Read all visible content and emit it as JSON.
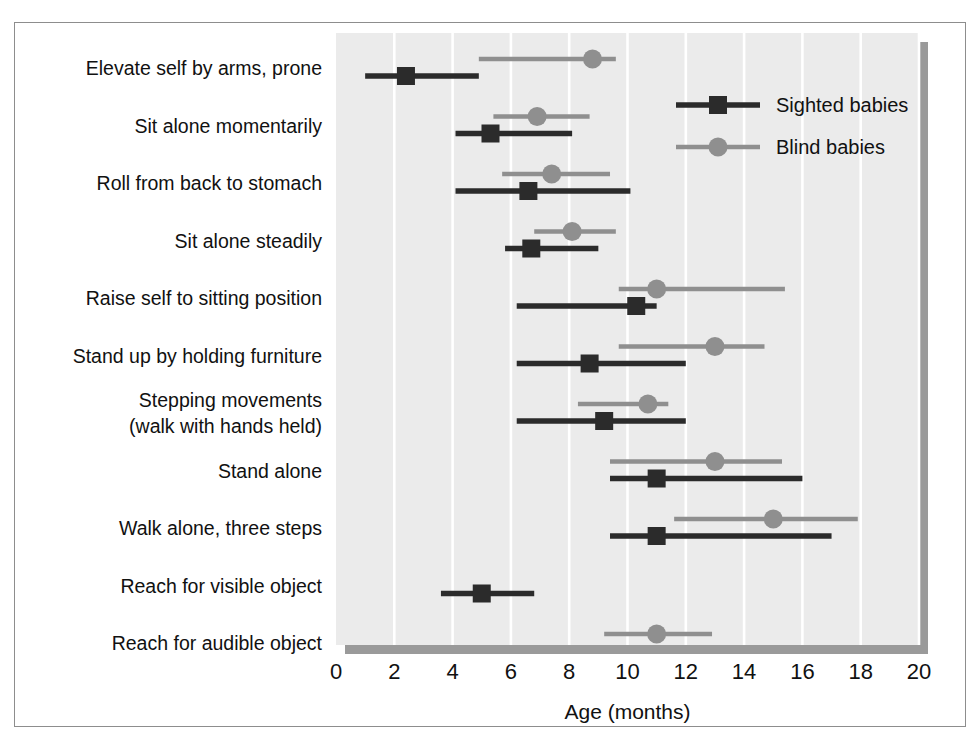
{
  "figure": {
    "border_color": "#8d8d8d",
    "background": "#ffffff"
  },
  "chart_data": {
    "type": "scatter",
    "subtype": "dot-plot-with-range-bars",
    "title": "",
    "xlabel": "Age (months)",
    "ylabel": "",
    "xlim": [
      0,
      20
    ],
    "xticks": [
      0,
      2,
      4,
      6,
      8,
      10,
      12,
      14,
      16,
      18,
      20
    ],
    "xtick_labels": [
      "0",
      "2",
      "4",
      "6",
      "8",
      "10",
      "12",
      "14",
      "16",
      "18",
      "20"
    ],
    "grid": "vertical",
    "grid_color": "#ffffff",
    "panel_color": "#ebebeb",
    "panel_shadow_color": "#9a9a9a",
    "legend_position": "top-right",
    "legend": [
      {
        "name": "Sighted babies",
        "marker": "square",
        "color": "#2b2b2b"
      },
      {
        "name": "Blind babies",
        "marker": "circle",
        "color": "#8f8f8f"
      }
    ],
    "categories": [
      "Elevate self by arms, prone",
      "Sit alone momentarily",
      "Roll from back to stomach",
      "Sit alone steadily",
      "Raise self to sitting position",
      "Stand up by holding furniture",
      "Stepping movements\n(walk with hands held)",
      "Stand alone",
      "Walk alone, three steps",
      "Reach for visible object",
      "Reach for audible object"
    ],
    "category_lines": [
      [
        "Elevate self by arms, prone"
      ],
      [
        "Sit alone momentarily"
      ],
      [
        "Roll from back to stomach"
      ],
      [
        "Sit alone steadily"
      ],
      [
        "Raise self to sitting position"
      ],
      [
        "Stand up by holding furniture"
      ],
      [
        "Stepping movements",
        "(walk with hands held)"
      ],
      [
        "Stand alone"
      ],
      [
        "Walk alone, three steps"
      ],
      [
        "Reach for visible object"
      ],
      [
        "Reach for audible object"
      ]
    ],
    "series": [
      {
        "name": "Sighted babies",
        "marker": "square",
        "color": "#2b2b2b",
        "points": [
          {
            "category": "Elevate self by arms, prone",
            "value": 2.4,
            "low": 1.0,
            "high": 4.9
          },
          {
            "category": "Sit alone momentarily",
            "value": 5.3,
            "low": 4.1,
            "high": 8.1
          },
          {
            "category": "Roll from back to stomach",
            "value": 6.6,
            "low": 4.1,
            "high": 10.1
          },
          {
            "category": "Sit alone steadily",
            "value": 6.7,
            "low": 5.8,
            "high": 9.0
          },
          {
            "category": "Raise self to sitting position",
            "value": 10.3,
            "low": 6.2,
            "high": 11.0
          },
          {
            "category": "Stand up by holding furniture",
            "value": 8.7,
            "low": 6.2,
            "high": 12.0
          },
          {
            "category": "Stepping movements",
            "value": 9.2,
            "low": 6.2,
            "high": 12.0
          },
          {
            "category": "Stand alone",
            "value": 11.0,
            "low": 9.4,
            "high": 16.0
          },
          {
            "category": "Walk alone, three steps",
            "value": 11.0,
            "low": 9.4,
            "high": 17.0
          },
          {
            "category": "Reach for visible object",
            "value": 5.0,
            "low": 3.6,
            "high": 6.8
          },
          {
            "category": "Reach for audible object",
            "value": null,
            "low": null,
            "high": null
          }
        ]
      },
      {
        "name": "Blind babies",
        "marker": "circle",
        "color": "#8f8f8f",
        "points": [
          {
            "category": "Elevate self by arms, prone",
            "value": 8.8,
            "low": 4.9,
            "high": 9.6
          },
          {
            "category": "Sit alone momentarily",
            "value": 6.9,
            "low": 5.4,
            "high": 8.7
          },
          {
            "category": "Roll from back to stomach",
            "value": 7.4,
            "low": 5.7,
            "high": 9.4
          },
          {
            "category": "Sit alone steadily",
            "value": 8.1,
            "low": 6.8,
            "high": 9.6
          },
          {
            "category": "Raise self to sitting position",
            "value": 11.0,
            "low": 9.7,
            "high": 15.4
          },
          {
            "category": "Stand up by holding furniture",
            "value": 13.0,
            "low": 9.7,
            "high": 14.7
          },
          {
            "category": "Stepping movements",
            "value": 10.7,
            "low": 8.3,
            "high": 11.4
          },
          {
            "category": "Stand alone",
            "value": 13.0,
            "low": 9.4,
            "high": 15.3
          },
          {
            "category": "Walk alone, three steps",
            "value": 15.0,
            "low": 11.6,
            "high": 17.9
          },
          {
            "category": "Reach for visible object",
            "value": null,
            "low": null,
            "high": null
          },
          {
            "category": "Reach for audible object",
            "value": 11.0,
            "low": 9.2,
            "high": 12.9
          }
        ]
      }
    ]
  }
}
